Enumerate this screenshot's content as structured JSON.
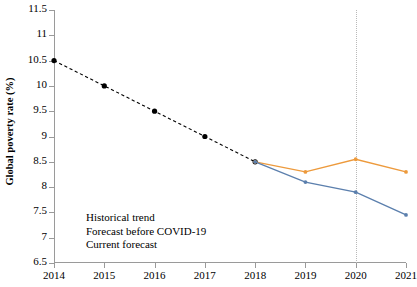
{
  "chart_data": {
    "type": "line",
    "title": "",
    "xlabel": "",
    "ylabel": "Global poverty rate (%)",
    "x": [
      2014,
      2015,
      2016,
      2017,
      2018,
      2019,
      2020,
      2021
    ],
    "xtick_labels": [
      "2014",
      "2015",
      "2016",
      "2017",
      "2018",
      "2019",
      "2020",
      "2021"
    ],
    "xlim": [
      2014,
      2021
    ],
    "ylim": [
      6.5,
      11.5
    ],
    "ytick_labels": [
      "6.5",
      "7",
      "7.5",
      "8",
      "8.5",
      "9",
      "9.5",
      "10",
      "10.5",
      "11",
      "11.5"
    ],
    "ytick_values": [
      6.5,
      7,
      7.5,
      8,
      8.5,
      9,
      9.5,
      10,
      10.5,
      11,
      11.5
    ],
    "grid": false,
    "legend_position": "lower left",
    "annotations": [
      {
        "name": "covid-marker-line",
        "type": "vline",
        "x": 2020,
        "style": "dotted",
        "color": "#b9b9b9"
      }
    ],
    "series": [
      {
        "name": "Historical trend",
        "color": "#000000",
        "style": "dashed",
        "marker": "circle",
        "x": [
          2014,
          2015,
          2016,
          2017,
          2018
        ],
        "values": [
          10.5,
          10.0,
          9.5,
          9.0,
          8.5
        ]
      },
      {
        "name": "Forecast before COVID-19",
        "color": "#ED9A3C",
        "style": "solid",
        "marker": "circle",
        "x": [
          2018,
          2019,
          2020,
          2021
        ],
        "values": [
          8.5,
          8.3,
          8.55,
          8.3
        ]
      },
      {
        "name": "Current forecast",
        "color": "#5B7FAD",
        "style": "solid",
        "marker": "circle",
        "x": [
          2018,
          2019,
          2020,
          2021
        ],
        "values": [
          8.5,
          8.1,
          7.9,
          7.45
        ]
      }
    ]
  },
  "legend": {
    "items": [
      {
        "label": "Historical trend"
      },
      {
        "label": "Forecast before COVID-19"
      },
      {
        "label": "Current forecast"
      }
    ]
  },
  "caption": {
    "text": ""
  }
}
